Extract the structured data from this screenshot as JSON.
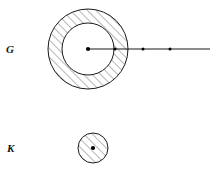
{
  "figure": {
    "background_color": "#ffffff",
    "stroke_color": "#1a1a1a",
    "hatch_color": "#4a4a4a",
    "point_color": "#000000",
    "labels": {
      "outer_region": "G",
      "inner_region": "K"
    },
    "annulus": {
      "name": "region-G-annulus",
      "center_x": 88,
      "center_y": 49,
      "outer_radius": 40,
      "inner_radius": 26,
      "hatched": true,
      "hatch_direction": "lower-left-to-upper-right",
      "fill": "none"
    },
    "disk": {
      "name": "region-K-disk",
      "center_x": 93,
      "center_y": 148,
      "radius": 15,
      "hatched": true,
      "hatch_direction": "lower-left-to-upper-right",
      "fill": "none"
    },
    "ray": {
      "name": "radial-ray",
      "start_x": 88,
      "start_y": 49,
      "end_x": 210,
      "end_y": 49
    },
    "points": [
      {
        "name": "center-point-G",
        "x": 88,
        "y": 49,
        "radius": 2.1
      },
      {
        "name": "ray-point-1",
        "x": 115,
        "y": 49,
        "radius": 1.5
      },
      {
        "name": "ray-point-2",
        "x": 143,
        "y": 49,
        "radius": 1.5
      },
      {
        "name": "ray-point-3",
        "x": 170,
        "y": 49,
        "radius": 1.5
      },
      {
        "name": "center-point-K",
        "x": 93,
        "y": 148,
        "radius": 2.1
      }
    ],
    "label_positions": {
      "outer_region": {
        "x": 6,
        "y": 49
      },
      "inner_region": {
        "x": 7,
        "y": 148
      }
    }
  }
}
